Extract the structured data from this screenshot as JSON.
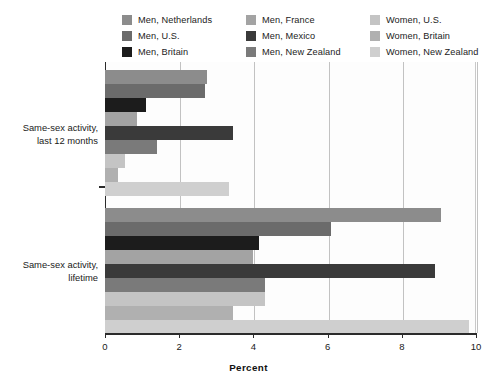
{
  "chart_data": {
    "type": "bar",
    "orientation": "horizontal",
    "title": "",
    "xlabel": "Percent",
    "ylabel": "",
    "xlim": [
      0,
      10
    ],
    "xticks": [
      0,
      2,
      4,
      6,
      8,
      10
    ],
    "xtick_labels": [
      "0",
      "2",
      "4",
      "6",
      "8",
      "10"
    ],
    "grid": true,
    "legend_position": "top",
    "categories": [
      "Same-sex activity, last 12 months",
      "Same-sex activity, lifetime"
    ],
    "category_lines": [
      [
        "Same-sex activity,",
        "last 12 months"
      ],
      [
        "Same-sex activity,",
        "lifetime"
      ]
    ],
    "series": [
      {
        "name": "Men, Netherlands",
        "color": "#8c8c8c",
        "values": [
          2.75,
          9.05
        ]
      },
      {
        "name": "Men, U.S.",
        "color": "#6b6b6b",
        "values": [
          2.7,
          6.1
        ]
      },
      {
        "name": "Men, Britain",
        "color": "#1c1c1c",
        "values": [
          1.1,
          4.15
        ]
      },
      {
        "name": "Men, France",
        "color": "#a3a3a3",
        "values": [
          0.85,
          4.0
        ]
      },
      {
        "name": "Men, Mexico",
        "color": "#3a3a3a",
        "values": [
          3.45,
          8.9
        ]
      },
      {
        "name": "Men, New Zealand",
        "color": "#7a7a7a",
        "values": [
          1.4,
          4.3
        ]
      },
      {
        "name": "Women, U.S.",
        "color": "#c4c4c4",
        "values": [
          0.55,
          4.3
        ]
      },
      {
        "name": "Women, Britain",
        "color": "#b0b0b0",
        "values": [
          0.35,
          3.45
        ]
      },
      {
        "name": "Women, New Zealand",
        "color": "#cfcfcf",
        "values": [
          3.35,
          9.8
        ]
      }
    ]
  },
  "legend": {
    "columns": [
      [
        {
          "label": "Men, Netherlands",
          "color": "#8c8c8c"
        },
        {
          "label": "Men, U.S.",
          "color": "#6b6b6b"
        },
        {
          "label": "Men, Britain",
          "color": "#1c1c1c"
        }
      ],
      [
        {
          "label": "Men, France",
          "color": "#a3a3a3"
        },
        {
          "label": "Men, Mexico",
          "color": "#3a3a3a"
        },
        {
          "label": "Men, New Zealand",
          "color": "#7a7a7a"
        }
      ],
      [
        {
          "label": "Women, U.S.",
          "color": "#c4c4c4"
        },
        {
          "label": "Women, Britain",
          "color": "#b0b0b0"
        },
        {
          "label": "Women, New Zealand",
          "color": "#cfcfcf"
        }
      ]
    ]
  }
}
